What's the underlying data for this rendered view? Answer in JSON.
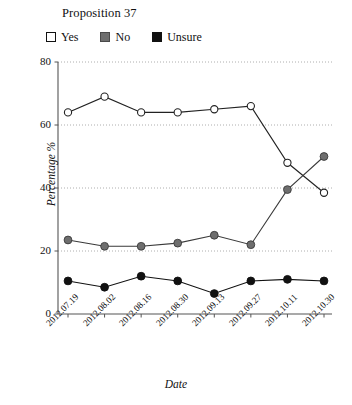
{
  "chart_data": {
    "type": "line",
    "title": "Proposition 37",
    "xlabel": "Date",
    "ylabel": "Percentage %",
    "ylim": [
      0,
      80
    ],
    "yticks": [
      0,
      20,
      40,
      60,
      80
    ],
    "grid": "horizontal-dotted",
    "legend_position": "top-left",
    "categories": [
      "2012.07.19",
      "2012.08.02",
      "2012.08.16",
      "2012.08.30",
      "2012.09.13",
      "2012.09.27",
      "2012.10.11",
      "2012.10.30"
    ],
    "series": [
      {
        "name": "Yes",
        "marker": "open-circle",
        "color": "#ffffff",
        "edge_color": "#222222",
        "values": [
          64,
          69,
          64,
          64,
          65,
          66,
          48,
          38.5
        ]
      },
      {
        "name": "No",
        "marker": "filled-circle",
        "color": "#6e6e6e",
        "edge_color": "#3a3a3a",
        "values": [
          23.5,
          21.5,
          21.5,
          22.5,
          25,
          22,
          39.5,
          50
        ]
      },
      {
        "name": "Unsure",
        "marker": "filled-circle",
        "color": "#111111",
        "edge_color": "#111111",
        "values": [
          10.5,
          8.5,
          12,
          10.5,
          6.5,
          10.5,
          11,
          10.5
        ]
      }
    ]
  },
  "legend": {
    "items": [
      {
        "label": "Yes",
        "swatch": "white-square-icon"
      },
      {
        "label": "No",
        "swatch": "gray-square-icon"
      },
      {
        "label": "Unsure",
        "swatch": "black-square-icon"
      }
    ]
  },
  "axis": {
    "y_tick_labels": [
      "80",
      "60",
      "40",
      "20",
      "0"
    ]
  }
}
